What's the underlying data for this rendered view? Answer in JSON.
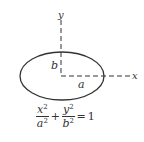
{
  "diagram": {
    "axes": {
      "x_label": "x",
      "y_label": "y"
    },
    "ellipse": {
      "semi_major_label": "a",
      "semi_minor_label": "b"
    },
    "equation": {
      "term1": {
        "numerator": "x",
        "denominator": "a",
        "exponent": "2"
      },
      "plus": "+",
      "term2": {
        "numerator": "y",
        "denominator": "b",
        "exponent": "2"
      },
      "equals": "=",
      "rhs": "1"
    },
    "colors": {
      "stroke": "#333333",
      "background": "#ffffff"
    }
  }
}
